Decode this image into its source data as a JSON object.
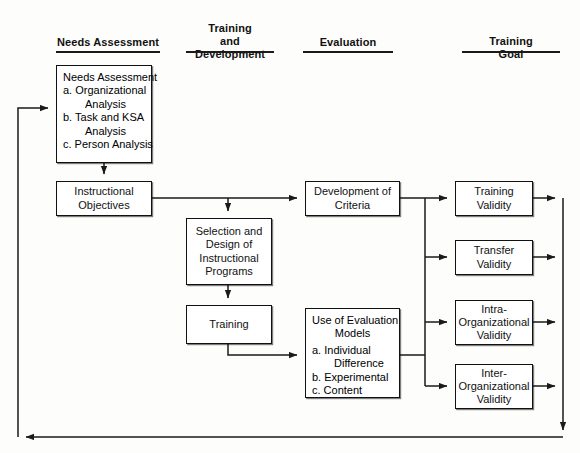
{
  "diagram": {
    "line_color": "#1a1a1a",
    "box_border_color": "#111111",
    "background": "#fdfdfc"
  },
  "columns": [
    {
      "id": "needs-assessment",
      "label": "Needs Assessment"
    },
    {
      "id": "training-and-development",
      "label": "Training\nand\nDevelopment"
    },
    {
      "id": "evaluation",
      "label": "Evaluation"
    },
    {
      "id": "training-goal",
      "label": "Training\nGoal"
    }
  ],
  "nodes": {
    "needs_assessment": {
      "heading": "Needs Assessment",
      "items": [
        "a. Organizational",
        "Analysis",
        "b. Task and KSA",
        "Analysis",
        "c. Person Analysis"
      ]
    },
    "instructional_objectives": {
      "line1": "Instructional",
      "line2": "Objectives"
    },
    "selection_design": {
      "line1": "Selection and",
      "line2": "Design of",
      "line3": "Instructional",
      "line4": "Programs"
    },
    "training": {
      "line1": "Training"
    },
    "development_of_criteria": {
      "line1": "Development of",
      "line2": "Criteria"
    },
    "use_of_evaluation_models": {
      "heading1": "Use of Evaluation",
      "heading2": "Models",
      "items": [
        "a. Individual",
        "Difference",
        "b. Experimental",
        "c. Content"
      ]
    },
    "training_validity": {
      "line1": "Training",
      "line2": "Validity"
    },
    "transfer_validity": {
      "line1": "Transfer",
      "line2": "Validity"
    },
    "intra_organizational_validity": {
      "line1": "Intra-",
      "line2": "Organizational",
      "line3": "Validity"
    },
    "inter_organizational_validity": {
      "line1": "Inter-",
      "line2": "Organizational",
      "line3": "Validity"
    }
  }
}
